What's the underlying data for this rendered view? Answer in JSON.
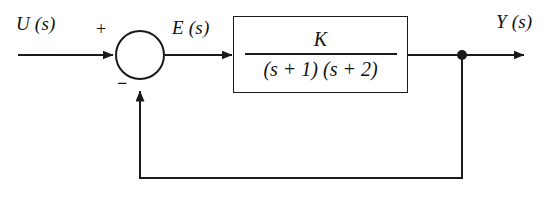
{
  "diagram": {
    "background_color": "#ffffff",
    "line_color": "#1a1a1a",
    "signals": {
      "input_label": "U (s)",
      "error_label": "E (s)",
      "output_label": "Y (s)"
    },
    "summing_junction": {
      "name": "summing-junction",
      "input_sign": "+",
      "feedback_sign": "−",
      "center_x": 140,
      "center_y": 55,
      "radius": 24
    },
    "plant_block": {
      "name": "transfer-function-block",
      "numerator": "K",
      "denominator": "(s + 1) (s + 2)",
      "transfer_function": "K / ((s + 1) (s + 2))"
    },
    "takeoff_point": {
      "name": "output-takeoff-node",
      "x": 462,
      "y": 55
    },
    "feedback_path": {
      "name": "unity-feedback-path",
      "gain": "1",
      "type": "negative"
    }
  }
}
